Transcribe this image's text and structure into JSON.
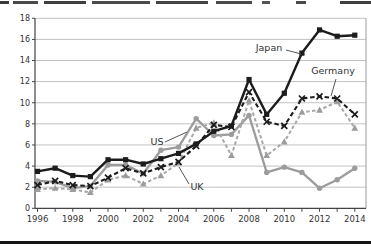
{
  "chart_data": {
    "type": "line",
    "title": "",
    "xlabel": "",
    "ylabel": "",
    "x": [
      1996,
      1997,
      1998,
      1999,
      2000,
      2001,
      2002,
      2003,
      2004,
      2005,
      2006,
      2007,
      2008,
      2009,
      2010,
      2011,
      2012,
      2013,
      2014
    ],
    "x_tick_labels": [
      "1996",
      "1998",
      "2000",
      "2002",
      "2004",
      "2006",
      "2008",
      "2010",
      "2012",
      "2014"
    ],
    "x_ticks_labeled": [
      1996,
      1998,
      2000,
      2002,
      2004,
      2006,
      2008,
      2010,
      2012,
      2014
    ],
    "ylim": [
      0,
      18
    ],
    "ytick_step": 2,
    "y_tick_labels": [
      "0",
      "2",
      "4",
      "6",
      "8",
      "10",
      "12",
      "14",
      "16",
      "18"
    ],
    "grid": true,
    "legend_position": "inline-labels",
    "series": [
      {
        "name": "US",
        "color": "#9c9c9c",
        "line": "solid",
        "marker": "circle",
        "values": [
          2.6,
          2.5,
          1.9,
          2.1,
          4.1,
          4.1,
          3.3,
          5.5,
          5.8,
          8.5,
          6.9,
          7.0,
          8.8,
          3.4,
          3.9,
          3.4,
          1.9,
          2.7,
          3.8
        ]
      },
      {
        "name": "UK",
        "color": "#a8a8a8",
        "line": "dashed",
        "marker": "triangle",
        "values": [
          1.8,
          1.9,
          1.8,
          1.5,
          2.7,
          3.1,
          2.3,
          3.1,
          4.3,
          7.6,
          8.1,
          5.0,
          10.2,
          5.0,
          6.3,
          9.1,
          9.3,
          10.1,
          7.6
        ]
      },
      {
        "name": "Germany",
        "color": "#1c1c1c",
        "line": "dashed",
        "marker": "x",
        "values": [
          2.2,
          2.6,
          2.2,
          2.1,
          2.9,
          3.8,
          3.3,
          3.9,
          4.4,
          5.9,
          7.9,
          7.7,
          11.0,
          8.2,
          7.8,
          10.4,
          10.6,
          10.4,
          8.9
        ]
      },
      {
        "name": "Japan",
        "color": "#1c1c1c",
        "line": "solid",
        "marker": "square",
        "values": [
          3.5,
          3.8,
          3.1,
          3.0,
          4.6,
          4.6,
          4.2,
          4.7,
          5.2,
          6.1,
          7.3,
          7.8,
          12.2,
          8.9,
          10.9,
          14.7,
          16.9,
          16.3,
          16.4
        ]
      }
    ],
    "inline_labels": [
      {
        "text": "Japan",
        "tx": 269,
        "ty": 51,
        "lx1": 286,
        "ly1": 50,
        "lx2": 301,
        "ly2": 54
      },
      {
        "text": "Germany",
        "tx": 333,
        "ty": 74,
        "lx1": 336,
        "ly1": 79,
        "lx2": 331,
        "ly2": 96
      },
      {
        "text": "US",
        "tx": 157,
        "ty": 145,
        "lx1": 165,
        "ly1": 142,
        "lx2": 187,
        "ly2": 132
      },
      {
        "text": "UK",
        "tx": 197,
        "ty": 190,
        "lx1": 189,
        "ly1": 184,
        "lx2": 179,
        "ly2": 167
      }
    ]
  }
}
